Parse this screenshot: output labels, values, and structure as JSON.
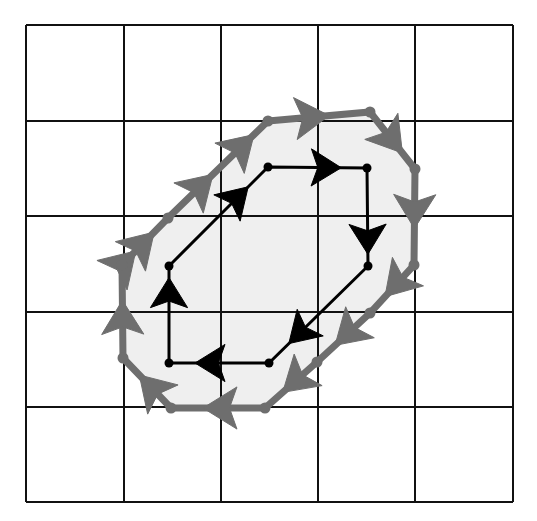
{
  "figure": {
    "canvas": {
      "width": 537,
      "height": 521,
      "background": "#ffffff"
    }
  },
  "grid": {
    "name": "square-grid",
    "rows": 5,
    "columns": 5,
    "stroke_color": "#111111",
    "stroke_width": 2.6,
    "x_lines": [
      26,
      124,
      221,
      318,
      415,
      513
    ],
    "y_lines": [
      25,
      121,
      216,
      312,
      407,
      502
    ],
    "cell_width": 97.4,
    "cell_height": 95.4
  },
  "shaded_region": {
    "name": "shaded-interior",
    "fill_color": "#efefef",
    "label": "shaded interior of outer polygon"
  },
  "inner_polygon": {
    "name": "inner-black-polygon",
    "stroke_color": "#000000",
    "stroke_width": 3,
    "vertex_marker": "filled-dot",
    "vertex_radius": 4.5,
    "arrow_style": "solid-triangle",
    "closed": true,
    "orientation": "counterclockwise",
    "vertex_count": 6,
    "vertices": [
      {
        "x": 268,
        "y": 167
      },
      {
        "x": 367,
        "y": 168
      },
      {
        "x": 368,
        "y": 266
      },
      {
        "x": 269,
        "y": 363
      },
      {
        "x": 169,
        "y": 363
      },
      {
        "x": 169,
        "y": 266
      }
    ],
    "edge_arrows": [
      {
        "from": 0,
        "to": 1,
        "t": 0.74
      },
      {
        "from": 1,
        "to": 2,
        "t": 0.88
      },
      {
        "from": 2,
        "to": 3,
        "t": 0.8
      },
      {
        "from": 3,
        "to": 4,
        "t": 0.74
      },
      {
        "from": 4,
        "to": 5,
        "t": 0.88
      },
      {
        "from": 5,
        "to": 0,
        "t": 0.8
      }
    ]
  },
  "outer_polygon": {
    "name": "outer-gray-polygon",
    "stroke_color": "#6e6e6e",
    "stroke_width": 7,
    "vertex_marker": "filled-dot",
    "vertex_radius": 5.5,
    "arrow_style": "solid-triangle",
    "closed": true,
    "orientation": "clockwise",
    "vertex_count": 11,
    "vertices": [
      {
        "x": 268,
        "y": 121
      },
      {
        "x": 370,
        "y": 112
      },
      {
        "x": 415,
        "y": 169
      },
      {
        "x": 414,
        "y": 265
      },
      {
        "x": 370,
        "y": 313
      },
      {
        "x": 317,
        "y": 362
      },
      {
        "x": 265,
        "y": 408
      },
      {
        "x": 171,
        "y": 408
      },
      {
        "x": 123,
        "y": 358
      },
      {
        "x": 122,
        "y": 265
      },
      {
        "x": 168,
        "y": 218
      }
    ],
    "edge_arrows": [
      {
        "from": 0,
        "to": 1,
        "t": 0.6
      },
      {
        "from": 1,
        "to": 2,
        "t": 0.72
      },
      {
        "from": 2,
        "to": 3,
        "t": 0.62
      },
      {
        "from": 3,
        "to": 4,
        "t": 0.66
      },
      {
        "from": 4,
        "to": 5,
        "t": 0.66
      },
      {
        "from": 5,
        "to": 6,
        "t": 0.66
      },
      {
        "from": 6,
        "to": 7,
        "t": 0.66
      },
      {
        "from": 7,
        "to": 8,
        "t": 0.66
      },
      {
        "from": 8,
        "to": 9,
        "t": 0.62
      },
      {
        "from": 9,
        "to": 10,
        "t": 0.7
      },
      {
        "from": 10,
        "to": 0,
        "t": 0.45
      }
    ],
    "extra_arrows": [
      {
        "from": 10,
        "to": 0,
        "t": 0.86
      },
      {
        "from": 9,
        "to": 10,
        "t": 0.3
      }
    ]
  }
}
